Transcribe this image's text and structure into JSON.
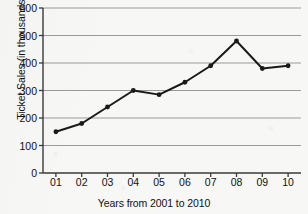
{
  "chart_data": {
    "type": "line",
    "title": "",
    "xlabel": "Years from 2001 to 2010",
    "ylabel": "Ticket Sales (in thousands)",
    "categories": [
      "01",
      "02",
      "03",
      "04",
      "05",
      "06",
      "07",
      "08",
      "09",
      "10"
    ],
    "values": [
      150,
      180,
      240,
      300,
      285,
      330,
      390,
      480,
      380,
      390
    ],
    "ylim": [
      0,
      600
    ],
    "yticks": [
      0,
      100,
      200,
      300,
      400,
      500,
      600
    ],
    "grid": true,
    "legend": "none",
    "series_color": "#1a1a1a",
    "grid_color": "#9a9a9a",
    "axis_color": "#3a3a3a",
    "background_color": "#f7f7f6"
  }
}
